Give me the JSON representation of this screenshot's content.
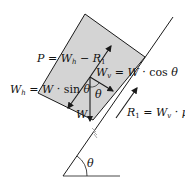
{
  "diagram": {
    "colors": {
      "block_fill": "#d4d4d4",
      "stroke": "#1a1a1a",
      "background": "#ffffff"
    },
    "labels": {
      "p_eq": {
        "lhs": "P",
        "eq": " = ",
        "a": "W",
        "a_sub": "h",
        "minus": " − ",
        "b": "R",
        "b_sub": "1"
      },
      "wv_eq": {
        "lhs": "W",
        "lhs_sub": "v",
        "eq": " = ",
        "a": "W",
        "dot": " · ",
        "fn": "cos ",
        "ang": "θ"
      },
      "wh_eq": {
        "lhs": "W",
        "lhs_sub": "h",
        "eq": " = ",
        "a": "W",
        "dot": " · ",
        "fn": "sin ",
        "ang": "θ"
      },
      "r1_eq": {
        "lhs": "R",
        "lhs_sub": "1",
        "eq": " = ",
        "a": "W",
        "a_sub": "v",
        "dot": " · ",
        "mu": "μ"
      },
      "weight": "W",
      "theta_block": "θ",
      "theta_incline": "θ"
    }
  }
}
